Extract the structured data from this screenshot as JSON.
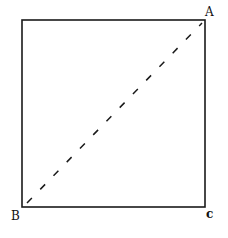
{
  "diagram": {
    "title": "",
    "square": {
      "x": 22,
      "y": 20,
      "width": 183,
      "height": 187,
      "stroke": "#1a1a1a"
    },
    "diagonal": {
      "from": "B",
      "to": "A",
      "style": "dashed",
      "stroke": "#1a1a1a"
    },
    "vertices": [
      {
        "id": "A",
        "label": "A",
        "x": 205,
        "y": 20
      },
      {
        "id": "B",
        "label": "B",
        "x": 22,
        "y": 207
      },
      {
        "id": "C",
        "label": "C",
        "x": 205,
        "y": 207
      }
    ],
    "labels": {
      "a": "A",
      "b": "B",
      "c": "c"
    }
  }
}
